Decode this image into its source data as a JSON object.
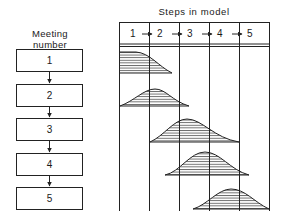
{
  "diagram": {
    "title": "Steps in model",
    "left_header": {
      "line1": "Meeting",
      "line2": "number"
    },
    "steps": [
      "1",
      "2",
      "3",
      "4",
      "5"
    ],
    "meetings": [
      {
        "label": "1",
        "activity_span_steps": "1-2",
        "peak_step": "1"
      },
      {
        "label": "2",
        "activity_span_steps": "1-3",
        "peak_step": "2"
      },
      {
        "label": "3",
        "activity_span_steps": "2-4",
        "peak_step": "3"
      },
      {
        "label": "4",
        "activity_span_steps": "2-5",
        "peak_step": "3-4"
      },
      {
        "label": "5",
        "activity_span_steps": "3-5",
        "peak_step": "4"
      }
    ],
    "colors": {
      "line": "#222222",
      "background": "#ffffff"
    }
  }
}
